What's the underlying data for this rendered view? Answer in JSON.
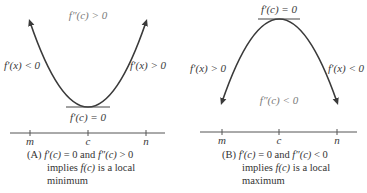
{
  "panels": [
    {
      "id": "A",
      "curve_type": "concave-up",
      "labels": {
        "second_derivative": "f″(c) > 0",
        "left_slope": "f′(x) < 0",
        "right_slope": "f′(x) > 0",
        "tangent": "f′(c) = 0"
      },
      "axis_ticks": [
        "m",
        "c",
        "n"
      ],
      "caption": {
        "tag": "(A)",
        "line1_a": "f′(c)",
        "line1_b": " = 0 and ",
        "line1_c": "f″(c)",
        "line1_d": " > 0",
        "line2_a": "implies ",
        "line2_b": "f(c)",
        "line2_c": " is a local",
        "line3": "minimum"
      }
    },
    {
      "id": "B",
      "curve_type": "concave-down",
      "labels": {
        "second_derivative": "f″(c) < 0",
        "left_slope": "f′(x) > 0",
        "right_slope": "f′(x) < 0",
        "tangent": "f′(c) = 0"
      },
      "axis_ticks": [
        "m",
        "c",
        "n"
      ],
      "caption": {
        "tag": "(B)",
        "line1_a": "f′(c)",
        "line1_b": " = 0 and ",
        "line1_c": "f″(c)",
        "line1_d": " < 0",
        "line2_a": "implies ",
        "line2_b": "f(c)",
        "line2_c": " is a local",
        "line3": "maximum"
      }
    }
  ],
  "colors": {
    "curve": "#3a3a3a",
    "axis": "#555555",
    "text": "#333333",
    "light_text": "#7a7a7a"
  }
}
